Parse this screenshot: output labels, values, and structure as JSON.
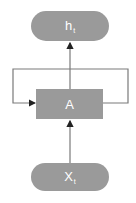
{
  "diagram": {
    "type": "recurrent-neural-network-cell",
    "colors": {
      "node_fill": "#9a9a9a",
      "node_text": "#ffffff",
      "edge": "#7a7a7a",
      "arrowhead": "#222222"
    },
    "nodes": {
      "output": {
        "label": "h",
        "subscript": "t"
      },
      "cell": {
        "label": "A"
      },
      "input": {
        "label": "X",
        "subscript": "t"
      }
    },
    "edges": [
      {
        "from": "input",
        "to": "cell"
      },
      {
        "from": "cell",
        "to": "output"
      },
      {
        "from": "cell",
        "to": "cell",
        "kind": "recurrent-loop"
      }
    ]
  }
}
